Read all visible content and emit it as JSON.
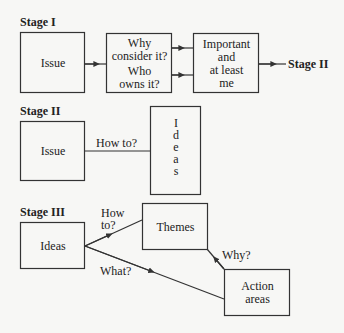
{
  "stage1": {
    "title": "Stage I",
    "box_issue": "Issue",
    "box_questions": {
      "line1": "Why",
      "line2": "consider it?",
      "line3": "Who",
      "line4": "owns it?"
    },
    "box_important": {
      "line1": "Important",
      "line2": "and",
      "line3": "at least",
      "line4": "me"
    },
    "next_stage": "Stage II"
  },
  "stage2": {
    "title": "Stage II",
    "box_issue": "Issue",
    "edge_label": "How to?",
    "box_ideas_letters": [
      "I",
      "d",
      "e",
      "a",
      "s"
    ]
  },
  "stage3": {
    "title": "Stage III",
    "box_ideas": "Ideas",
    "box_themes": "Themes",
    "box_action": {
      "line1": "Action",
      "line2": "areas"
    },
    "edge_howto": {
      "line1": "How",
      "line2": "to?"
    },
    "edge_what": "What?",
    "edge_why": "Why?"
  },
  "colors": {
    "stroke": "#333333",
    "background": "#f7f7f5",
    "text": "#222222"
  }
}
